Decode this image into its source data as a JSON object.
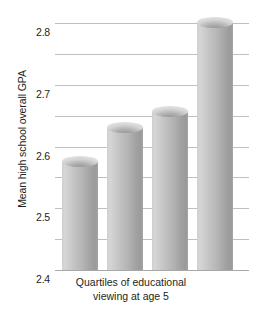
{
  "chart_data": {
    "type": "bar",
    "title": "",
    "xlabel": "Quartiles of educational viewing at age 5",
    "xlabel_line1": "Quartiles of educational",
    "xlabel_line2": "viewing at age 5",
    "ylabel": "Mean high school overall GPA",
    "categories": [
      "1",
      "2",
      "3",
      "4"
    ],
    "values": [
      2.37,
      2.48,
      2.53,
      2.82
    ],
    "ylim": [
      2.0,
      2.8
    ],
    "ytick_labels": [
      "2.8",
      "2.7",
      "2.6",
      "2.5",
      "2.4",
      "2.3",
      "2.2",
      "2.1",
      "2.0"
    ],
    "ytick_values": [
      2.8,
      2.7,
      2.6,
      2.5,
      2.4,
      2.3,
      2.2,
      2.1,
      2.0
    ],
    "grid": true,
    "legend": false,
    "legend_position": "none",
    "bar_style": "3d-cylinder",
    "colors": {
      "bar_light": "#d6d6d6",
      "bar_dark": "#9a9a9a",
      "gridline": "#bfbfbf",
      "baseline": "#a8a8a8",
      "text": "#231f20",
      "background": "#ffffff"
    }
  }
}
